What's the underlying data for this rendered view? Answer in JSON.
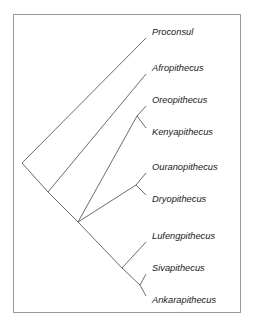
{
  "figure": {
    "type": "cladogram",
    "title": "",
    "border_color": "#9a9a9a",
    "branch_color": "#5a5a5a",
    "label_color": "#1a1a1a",
    "background": "#ffffff"
  },
  "chart_data": {
    "type": "diagram",
    "subtype": "cladogram",
    "title": "",
    "xlabel": "",
    "ylabel": "",
    "grid": false,
    "legend": false,
    "orientation": "diagonal-left-root",
    "taxa": [
      "Proconsul",
      "Afropithecus",
      "Oreopithecus",
      "Kenyapithecus",
      "Ouranopithecus",
      "Dryopithecus",
      "Lufengpithecus",
      "Sivapithecus",
      "Ankarapithecus"
    ],
    "newick": "(Proconsul,(Afropithecus,((Oreopithecus,Kenyapithecus),((Ouranopithecus,Dryopithecus),(Lufengpithecus,(Sivapithecus,Ankarapithecus))))));",
    "tips": [
      {
        "name": "Proconsul",
        "x": 152,
        "y": 33,
        "tip_x": 146,
        "tip_y": 38
      },
      {
        "name": "Afropithecus",
        "x": 152,
        "y": 69,
        "tip_x": 146,
        "tip_y": 74
      },
      {
        "name": "Oreopithecus",
        "x": 152,
        "y": 101,
        "tip_x": 146,
        "tip_y": 106
      },
      {
        "name": "Kenyapithecus",
        "x": 152,
        "y": 133,
        "tip_x": 146,
        "tip_y": 128
      },
      {
        "name": "Ouranopithecus",
        "x": 152,
        "y": 168,
        "tip_x": 146,
        "tip_y": 173
      },
      {
        "name": "Dryopithecus",
        "x": 152,
        "y": 200,
        "tip_x": 146,
        "tip_y": 195
      },
      {
        "name": "Lufengpithecus",
        "x": 152,
        "y": 237,
        "tip_x": 146,
        "tip_y": 242
      },
      {
        "name": "Sivapithecus",
        "x": 152,
        "y": 269,
        "tip_x": 146,
        "tip_y": 274
      },
      {
        "name": "Ankarapithecus",
        "x": 152,
        "y": 301,
        "tip_x": 146,
        "tip_y": 296
      }
    ],
    "nodes": [
      {
        "id": "root",
        "x": 22,
        "y": 163,
        "label": ""
      },
      {
        "id": "n_afro",
        "x": 48,
        "y": 192,
        "label": ""
      },
      {
        "id": "n_crown",
        "x": 78,
        "y": 222,
        "label": ""
      },
      {
        "id": "n_oreo",
        "x": 137,
        "y": 116,
        "label": ""
      },
      {
        "id": "n_oura",
        "x": 136,
        "y": 185,
        "label": ""
      },
      {
        "id": "n_pongine",
        "x": 122,
        "y": 268,
        "label": ""
      },
      {
        "id": "n_siva",
        "x": 140,
        "y": 285,
        "label": ""
      }
    ],
    "edges": [
      {
        "from": "root",
        "to": "Proconsul",
        "x1": 22,
        "y1": 163,
        "x2": 146,
        "y2": 38
      },
      {
        "from": "root",
        "to": "n_afro",
        "x1": 22,
        "y1": 163,
        "x2": 48,
        "y2": 192
      },
      {
        "from": "n_afro",
        "to": "Afropithecus",
        "x1": 48,
        "y1": 192,
        "x2": 146,
        "y2": 74
      },
      {
        "from": "n_afro",
        "to": "n_crown",
        "x1": 48,
        "y1": 192,
        "x2": 78,
        "y2": 222
      },
      {
        "from": "n_crown",
        "to": "n_oreo",
        "x1": 78,
        "y1": 222,
        "x2": 137,
        "y2": 116
      },
      {
        "from": "n_oreo",
        "to": "Oreopithecus",
        "x1": 137,
        "y1": 116,
        "x2": 146,
        "y2": 106
      },
      {
        "from": "n_oreo",
        "to": "Kenyapithecus",
        "x1": 137,
        "y1": 116,
        "x2": 146,
        "y2": 128
      },
      {
        "from": "n_crown",
        "to": "n_oura",
        "x1": 78,
        "y1": 222,
        "x2": 136,
        "y2": 185
      },
      {
        "from": "n_oura",
        "to": "Ouranopithecus",
        "x1": 136,
        "y1": 185,
        "x2": 146,
        "y2": 173
      },
      {
        "from": "n_oura",
        "to": "Dryopithecus",
        "x1": 136,
        "y1": 185,
        "x2": 146,
        "y2": 195
      },
      {
        "from": "n_crown",
        "to": "n_pongine",
        "x1": 78,
        "y1": 222,
        "x2": 122,
        "y2": 268
      },
      {
        "from": "n_pongine",
        "to": "Lufengpithecus",
        "x1": 122,
        "y1": 268,
        "x2": 146,
        "y2": 242
      },
      {
        "from": "n_pongine",
        "to": "n_siva",
        "x1": 122,
        "y1": 268,
        "x2": 140,
        "y2": 285
      },
      {
        "from": "n_siva",
        "to": "Sivapithecus",
        "x1": 140,
        "y1": 285,
        "x2": 146,
        "y2": 274
      },
      {
        "from": "n_siva",
        "to": "Ankarapithecus",
        "x1": 140,
        "y1": 285,
        "x2": 146,
        "y2": 296
      }
    ]
  },
  "frame": {
    "x": 13,
    "y": 14,
    "width": 227,
    "height": 298
  }
}
